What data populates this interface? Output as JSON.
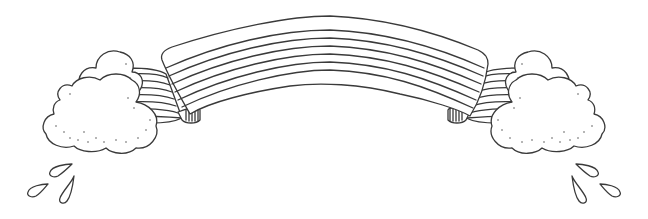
{
  "illustration": {
    "subject": "rainbow banner with clouds and raindrops",
    "style": "black line art on white",
    "colors": {
      "background": "#ffffff",
      "stroke": "#3a3a3a",
      "stipple": "#5a5a5a"
    },
    "banner": {
      "stripe_count": 7,
      "label": ""
    },
    "clouds": [
      {
        "side": "left"
      },
      {
        "side": "right"
      }
    ],
    "raindrops": {
      "left_count": 3,
      "right_count": 3
    }
  }
}
